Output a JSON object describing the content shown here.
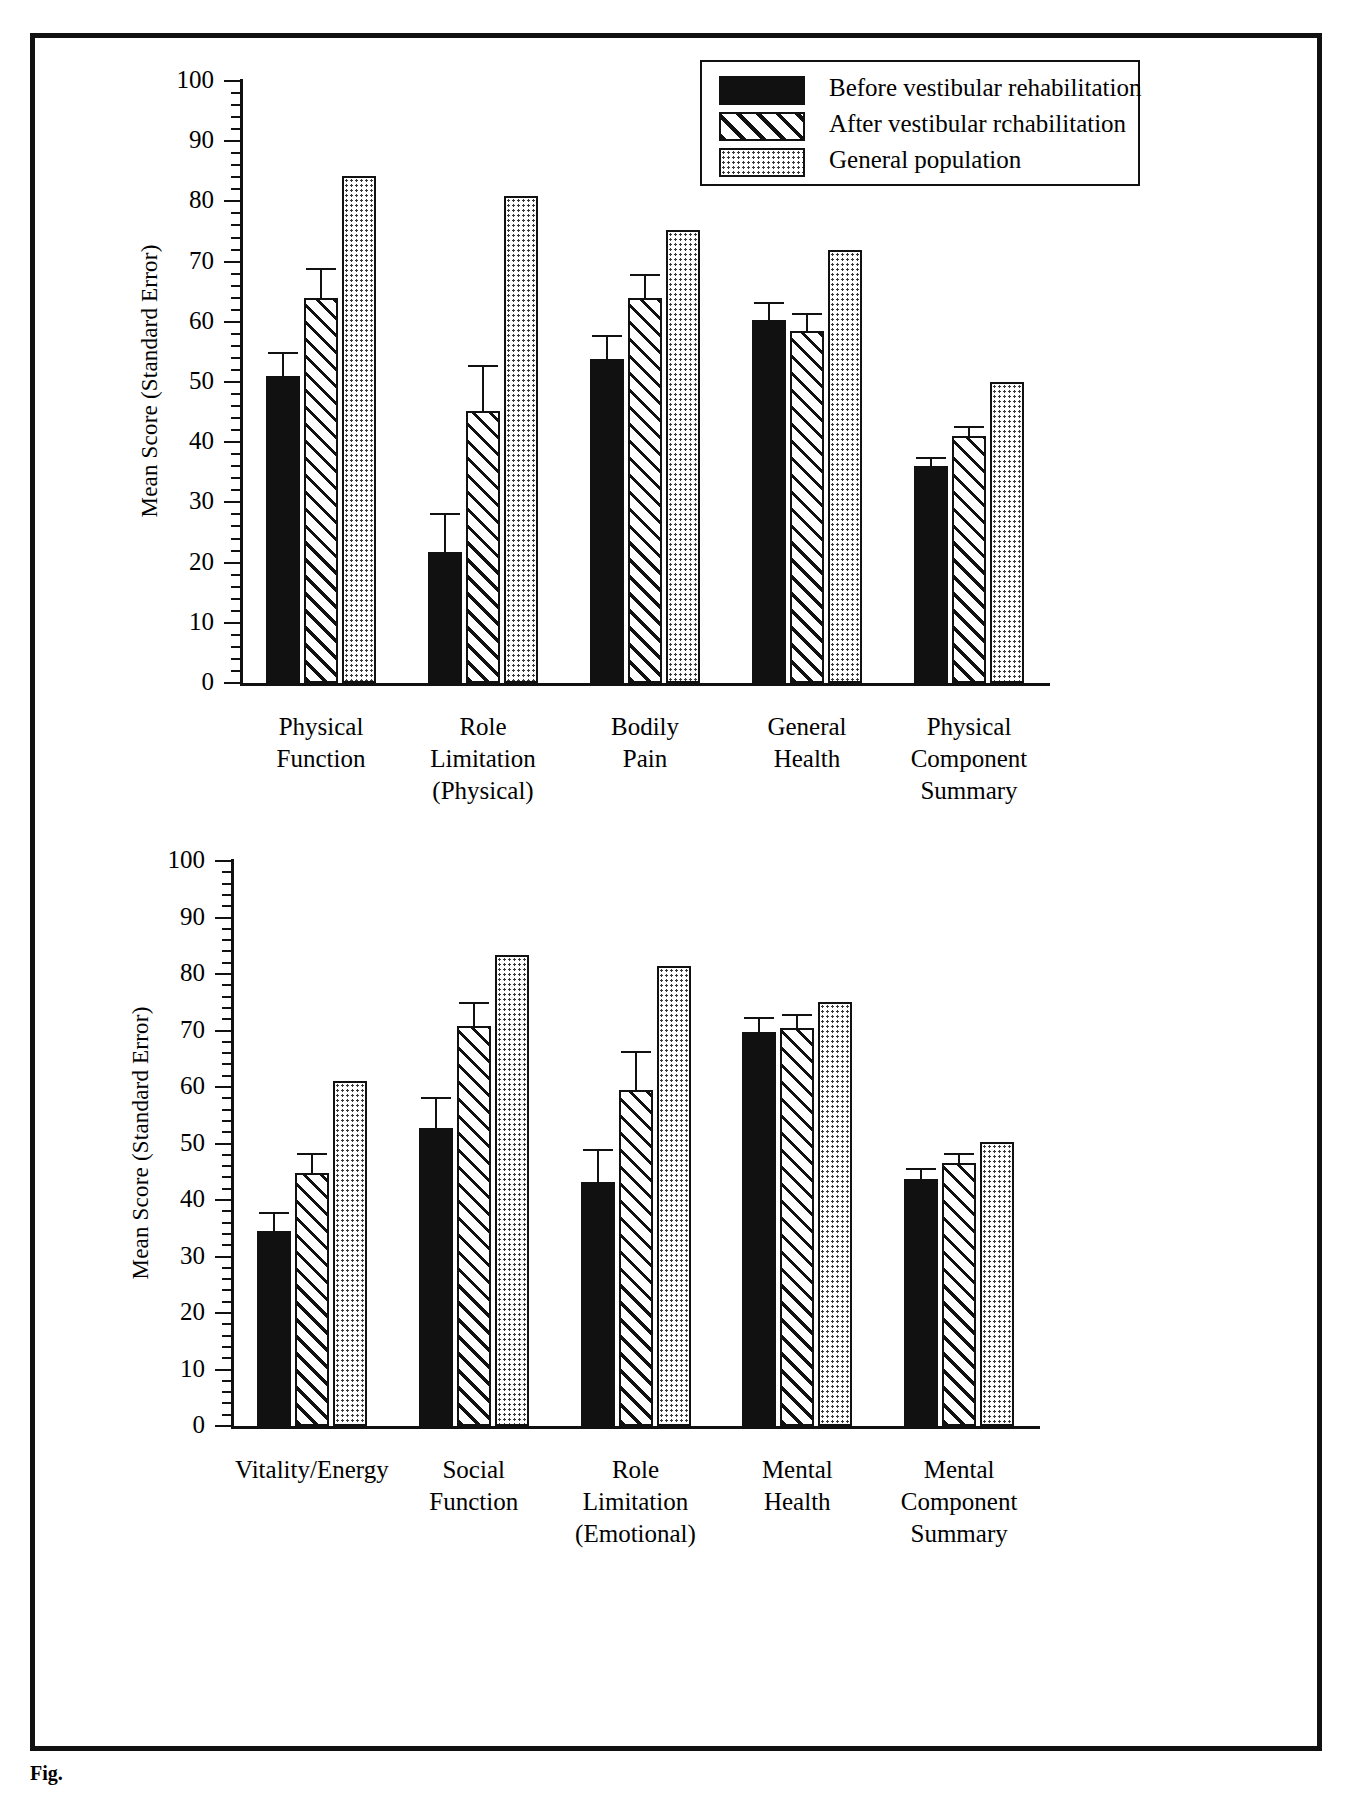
{
  "legend": {
    "position": "top-right-panel1",
    "entries": [
      {
        "label": "Before vestibular rehabilitation",
        "pattern": "solid-black",
        "color": "#111111"
      },
      {
        "label": "After vestibular rchabilitation",
        "pattern": "diagonal-hatch",
        "color": "#ffffff"
      },
      {
        "label": "General population",
        "pattern": "stipple-dots",
        "color": "#dddddd"
      }
    ]
  },
  "axis": {
    "ylabel": "Mean Score (Standard Error)",
    "yticks": [
      0,
      10,
      20,
      30,
      40,
      50,
      60,
      70,
      80,
      90,
      100
    ],
    "ylim": [
      0,
      100
    ],
    "minor_tick_step": 2
  },
  "chart_data": [
    {
      "type": "bar",
      "panel": "physical",
      "title": "",
      "xlabel": "",
      "ylabel": "Mean Score (Standard Error)",
      "ylim": [
        0,
        100
      ],
      "grid": false,
      "legend_position": "upper right",
      "categories": [
        "Physical\nFunction",
        "Role\nLimitation\n(Physical)",
        "Bodily\nPain",
        "General\nHealth",
        "Physical\nComponent\nSummary"
      ],
      "series": [
        {
          "name": "Before vestibular rehabilitation",
          "values": [
            51.0,
            21.8,
            53.8,
            60.3,
            36.0
          ],
          "errors": [
            4.0,
            6.4,
            4.0,
            3.0,
            1.6
          ]
        },
        {
          "name": "After vestibular rchabilitation",
          "values": [
            63.9,
            45.2,
            63.9,
            58.4,
            41.1
          ],
          "errors": [
            5.0,
            7.6,
            4.0,
            3.0,
            1.6
          ]
        },
        {
          "name": "General population",
          "values": [
            84.2,
            80.9,
            75.2,
            72.0,
            50.0
          ],
          "errors": [
            0,
            0,
            0,
            0,
            0
          ]
        }
      ]
    },
    {
      "type": "bar",
      "panel": "mental",
      "title": "",
      "xlabel": "",
      "ylabel": "Mean Score (Standard Error)",
      "ylim": [
        0,
        100
      ],
      "grid": false,
      "legend_position": "none",
      "categories": [
        "Vitality/Energy",
        "Social\nFunction",
        "Role\nLimitation\n(Emotional)",
        "Mental\nHealth",
        "Mental\nComponent\nSummary"
      ],
      "series": [
        {
          "name": "Before vestibular rehabilitation",
          "values": [
            34.6,
            52.7,
            43.2,
            69.7,
            43.7
          ],
          "errors": [
            3.3,
            5.5,
            5.8,
            2.7,
            1.9
          ]
        },
        {
          "name": "After vestibular rchabilitation",
          "values": [
            44.7,
            70.8,
            59.4,
            70.5,
            46.6
          ],
          "errors": [
            3.7,
            4.2,
            7.0,
            2.5,
            1.8
          ]
        },
        {
          "name": "General population",
          "values": [
            61.0,
            83.4,
            81.5,
            75.0,
            50.2
          ],
          "errors": [
            0,
            0,
            0,
            0,
            0
          ]
        }
      ]
    }
  ],
  "caption": {
    "text": "Fig."
  }
}
